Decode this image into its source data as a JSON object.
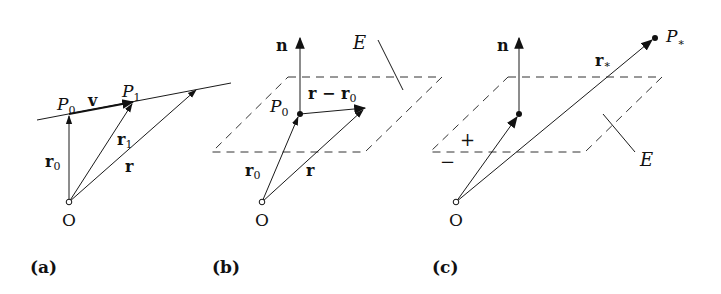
{
  "panels": [
    {
      "id": "a",
      "caption": "(a)",
      "labels": {
        "P0": "P",
        "P0_sub": "0",
        "v": "v",
        "P1": "P",
        "P1_sub": "1",
        "r0": "r",
        "r0_sub": "0",
        "r1": "r",
        "r1_sub": "1",
        "r": "r",
        "O": "O"
      }
    },
    {
      "id": "b",
      "caption": "(b)",
      "labels": {
        "n": "n",
        "E": "E",
        "P0": "P",
        "P0_sub": "0",
        "r_minus_r0": "r − r",
        "r_minus_r0_sub": "0",
        "r0": "r",
        "r0_sub": "0",
        "r": "r",
        "O": "O"
      }
    },
    {
      "id": "c",
      "caption": "(c)",
      "labels": {
        "n": "n",
        "P_star": "P",
        "P_star_sub": "∗",
        "r_star": "r",
        "r_star_sub": "∗",
        "plus": "+",
        "minus": "−",
        "E": "E",
        "O": "O"
      }
    }
  ]
}
